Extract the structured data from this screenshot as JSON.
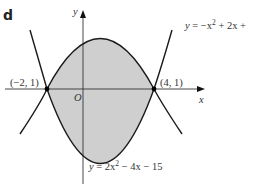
{
  "figure": {
    "part_label": "d",
    "axes": {
      "x_label": "x",
      "y_label": "y",
      "origin_label": "O"
    },
    "curves": [
      {
        "name": "upper-parabola",
        "equation_prefix": "y",
        "equation_rest": " = −x",
        "exp": "2",
        "equation_tail": " + 2x +"
      },
      {
        "name": "lower-parabola",
        "equation_prefix": "y",
        "equation_rest": " = 2x",
        "exp": "2",
        "equation_tail": " − 4x − 15"
      }
    ],
    "points": [
      {
        "label": "(−2,  1)",
        "x": -2,
        "y": 1
      },
      {
        "label": "(4,  1)",
        "x": 4,
        "y": 1
      }
    ],
    "colors": {
      "shade": "#cfcfcf",
      "stroke": "#1a1a1a",
      "axis": "#333333"
    }
  }
}
